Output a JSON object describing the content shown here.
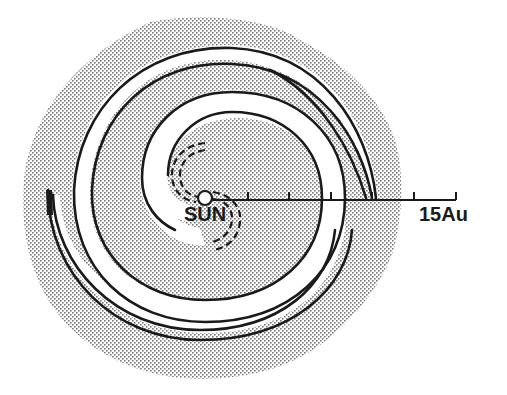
{
  "figure": {
    "type": "spiral-structure-diagram",
    "center_label": "SUN",
    "scale_label": "15Au",
    "scale": {
      "max_au": 15,
      "tick_count": 6,
      "tick_spacing_au": 2.5,
      "unit": "Au"
    },
    "elements": {
      "arms": 2,
      "inner_arm_dashed": true,
      "background": "stippled"
    },
    "colors": {
      "ink": "#1a1a1a",
      "stipple": "#8a8a8a",
      "background": "#ffffff"
    }
  }
}
